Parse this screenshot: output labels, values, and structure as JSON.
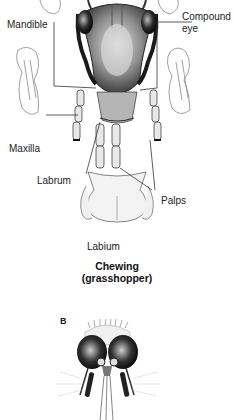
{
  "figure": {
    "panel_a": {
      "labels": {
        "mandible": "Mandible",
        "compound_eye_line1": "Compound",
        "compound_eye_line2": "eye",
        "maxilla": "Maxilla",
        "labrum": "Labrum",
        "palps": "Palps",
        "labium": "Labium"
      },
      "caption_line1": "Chewing",
      "caption_line2": "(grasshopper)"
    },
    "panel_b": {
      "panel_letter": "B"
    }
  }
}
